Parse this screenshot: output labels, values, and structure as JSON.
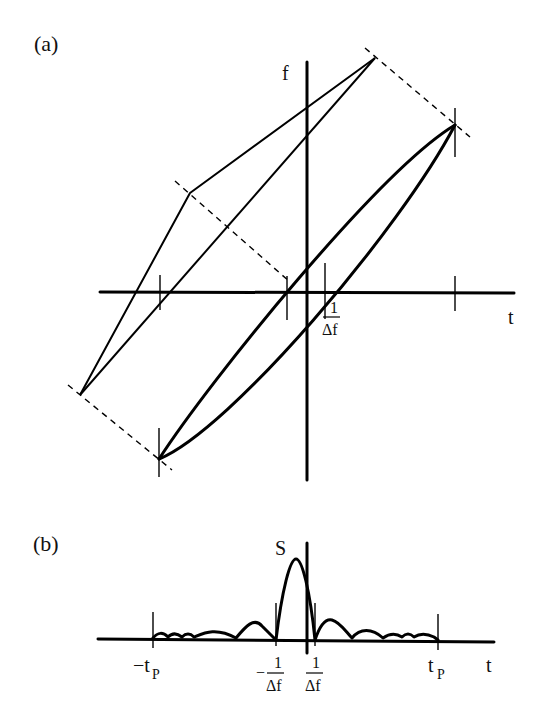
{
  "figure": {
    "panel_a": {
      "label": "(a)",
      "axis_f_label": "f",
      "axis_t_label": "t",
      "tick_label_num": "1",
      "tick_label_den": "Δf"
    },
    "panel_b": {
      "label": "(b)",
      "axis_s_label": "S",
      "axis_t_label": "t",
      "neg_tp_label": "−t",
      "pos_tp_label": "t",
      "tp_subscript": "P",
      "neg_inv_df_sign": "−",
      "inv_df_num": "1",
      "inv_df_den": "Δf"
    }
  },
  "colors": {
    "ink": "#000000",
    "background": "#ffffff"
  }
}
